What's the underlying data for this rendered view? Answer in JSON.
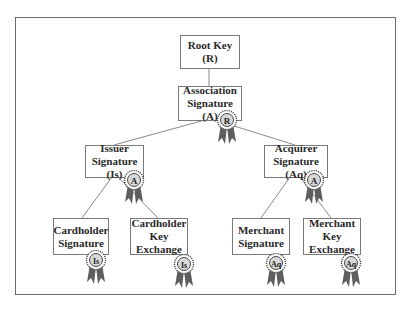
{
  "diagram": {
    "nodes": [
      {
        "id": "root",
        "lines": [
          "Root Key",
          "(R)"
        ],
        "seal": null
      },
      {
        "id": "association",
        "lines": [
          "Association",
          "Signature (A)"
        ],
        "seal": "R"
      },
      {
        "id": "issuer",
        "lines": [
          "Issuer",
          "Signature (Is)"
        ],
        "seal": "A"
      },
      {
        "id": "acquirer",
        "lines": [
          "Acquirer",
          "Signature (Aq)"
        ],
        "seal": "A"
      },
      {
        "id": "cardholder-signature",
        "lines": [
          "Cardholder",
          "Signature"
        ],
        "seal": "Is"
      },
      {
        "id": "cardholder-key-exchange",
        "lines": [
          "Cardholder",
          "Key",
          "Exchange"
        ],
        "seal": "Is"
      },
      {
        "id": "merchant-signature",
        "lines": [
          "Merchant",
          "Signature"
        ],
        "seal": "Aq"
      },
      {
        "id": "merchant-key-exchange",
        "lines": [
          "Merchant",
          "Key",
          "Exchange"
        ],
        "seal": "Aq"
      }
    ],
    "edges": [
      [
        "root",
        "association"
      ],
      [
        "association",
        "issuer"
      ],
      [
        "association",
        "acquirer"
      ],
      [
        "issuer",
        "cardholder-signature"
      ],
      [
        "issuer",
        "cardholder-key-exchange"
      ],
      [
        "acquirer",
        "merchant-signature"
      ],
      [
        "acquirer",
        "merchant-key-exchange"
      ]
    ],
    "colors": {
      "border": "#7a7a7a",
      "line": "#8a8a8a",
      "ribbon": "#5e5e5e",
      "seal_ring": "#4a4a4a",
      "seal_fill": "#d8d8d8",
      "text": "#2a2a2a"
    }
  }
}
